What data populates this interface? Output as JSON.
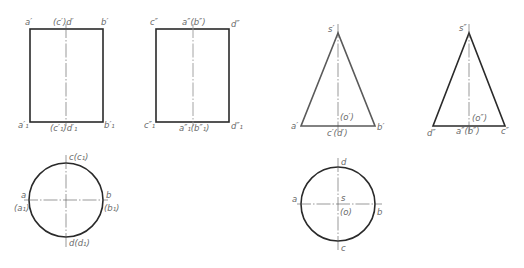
{
  "colors": {
    "outline": "#2a2a2a",
    "outline_light": "#5a5a5a",
    "label": "#6a6a6a",
    "centerline": "#555555",
    "background": "#ffffff"
  },
  "figures": {
    "cylinder_front": {
      "title": "Cylinder front view",
      "labels": {
        "top_left": "a′",
        "top_center": "(c′)d′",
        "top_right": "b′",
        "bottom_left": "a′₁",
        "bottom_center": "(c′₁)d′₁",
        "bottom_right": "b′₁"
      }
    },
    "cylinder_side": {
      "title": "Cylinder side view",
      "labels": {
        "top_left": "c″",
        "top_center": "a″(b″)",
        "top_right": "d″",
        "bottom_left": "c″₁",
        "bottom_center": "a″₁(b″₁)",
        "bottom_right": "d″₁"
      }
    },
    "cylinder_top": {
      "title": "Cylinder top view",
      "labels": {
        "top": "c(c₁)",
        "left_upper": "a",
        "left_lower": "(a₁)",
        "right_upper": "b",
        "right_lower": "(b₁)",
        "bottom": "d(d₁)"
      }
    },
    "cone_front": {
      "title": "Cone front view",
      "labels": {
        "apex": "s′",
        "center": "(o′)",
        "left": "a′",
        "bottom_center": "c′(d′)",
        "right": "b′"
      }
    },
    "cone_side": {
      "title": "Cone side view",
      "labels": {
        "apex": "s″",
        "center": "(o″)",
        "left": "d″",
        "bottom_center": "a″(b″)",
        "right": "c″"
      }
    },
    "cone_top": {
      "title": "Cone top view",
      "labels": {
        "top": "d",
        "left": "a",
        "center_upper": "s",
        "center_lower": "(o)",
        "right": "b",
        "bottom": "c"
      }
    }
  }
}
